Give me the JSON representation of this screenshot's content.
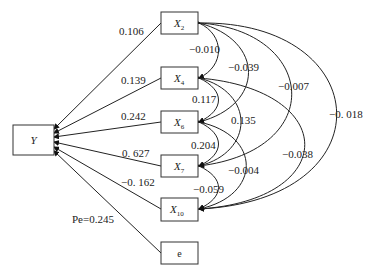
{
  "diagram": {
    "type": "path-diagram",
    "dependent": {
      "label": "Y"
    },
    "nodes": [
      {
        "id": "X2",
        "base": "X",
        "sub": "2"
      },
      {
        "id": "X4",
        "base": "X",
        "sub": "4"
      },
      {
        "id": "X6",
        "base": "X",
        "sub": "6"
      },
      {
        "id": "X7",
        "base": "X",
        "sub": "7"
      },
      {
        "id": "X10",
        "base": "X",
        "sub": "10"
      },
      {
        "id": "e",
        "base": "e",
        "sub": ""
      }
    ],
    "paths": [
      {
        "from": "X2",
        "to": "Y",
        "coef": "0.106"
      },
      {
        "from": "X4",
        "to": "Y",
        "coef": "0.139"
      },
      {
        "from": "X6",
        "to": "Y",
        "coef": "0.242"
      },
      {
        "from": "X7",
        "to": "Y",
        "coef": "0. 627"
      },
      {
        "from": "X10",
        "to": "Y",
        "coef": "−0. 162"
      },
      {
        "from": "e",
        "to": "Y",
        "coef": "Pe=0.245"
      }
    ],
    "correlations": [
      {
        "a": "X2",
        "b": "X4",
        "r": "−0.010"
      },
      {
        "a": "X2",
        "b": "X6",
        "r": "−0.039"
      },
      {
        "a": "X2",
        "b": "X7",
        "r": "−0.007"
      },
      {
        "a": "X2",
        "b": "X10",
        "r": "−0. 018"
      },
      {
        "a": "X4",
        "b": "X6",
        "r": "0.117"
      },
      {
        "a": "X4",
        "b": "X7",
        "r": "0.135"
      },
      {
        "a": "X4",
        "b": "X10",
        "r": "−0.038"
      },
      {
        "a": "X6",
        "b": "X7",
        "r": "0.204"
      },
      {
        "a": "X6",
        "b": "X10",
        "r": "−0.004"
      },
      {
        "a": "X7",
        "b": "X10",
        "r": "−0.059"
      }
    ]
  }
}
